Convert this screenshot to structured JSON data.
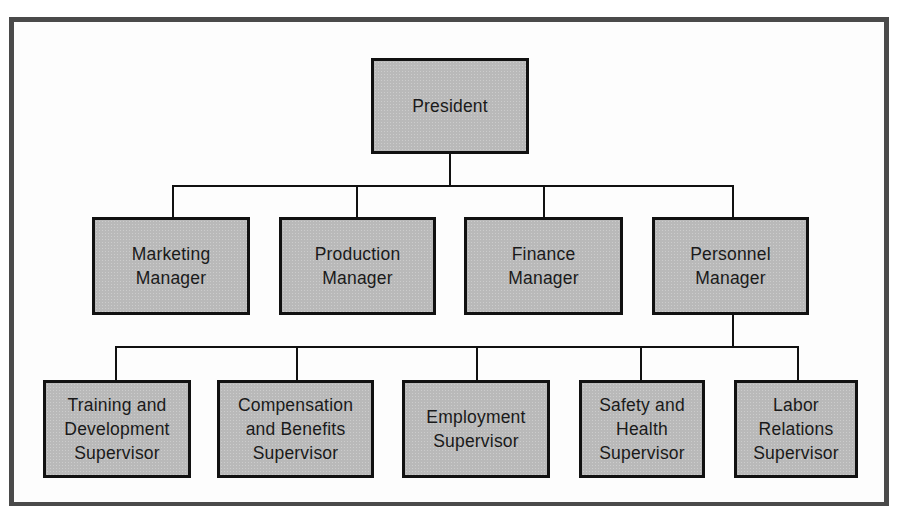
{
  "diagram": {
    "type": "organization-chart",
    "colors": {
      "box_fill": "#b9b9b9",
      "box_border": "#111111",
      "frame": "#4a4a4a",
      "background": "#ffffff"
    },
    "root": {
      "id": "president",
      "label": "President"
    },
    "managers": [
      {
        "id": "marketing",
        "label": "Marketing\nManager"
      },
      {
        "id": "production",
        "label": "Production\nManager"
      },
      {
        "id": "finance",
        "label": "Finance\nManager"
      },
      {
        "id": "personnel",
        "label": "Personnel\nManager"
      }
    ],
    "supervisors_parent": "personnel",
    "supervisors": [
      {
        "id": "training",
        "label": "Training and\nDevelopment\nSupervisor"
      },
      {
        "id": "compensation",
        "label": "Compensation\nand Benefits\nSupervisor"
      },
      {
        "id": "employment",
        "label": "Employment\nSupervisor"
      },
      {
        "id": "safety",
        "label": "Safety and\nHealth\nSupervisor"
      },
      {
        "id": "labor",
        "label": "Labor\nRelations\nSupervisor"
      }
    ],
    "edges": [
      [
        "president",
        "marketing"
      ],
      [
        "president",
        "production"
      ],
      [
        "president",
        "finance"
      ],
      [
        "president",
        "personnel"
      ],
      [
        "personnel",
        "training"
      ],
      [
        "personnel",
        "compensation"
      ],
      [
        "personnel",
        "employment"
      ],
      [
        "personnel",
        "safety"
      ],
      [
        "personnel",
        "labor"
      ]
    ]
  }
}
